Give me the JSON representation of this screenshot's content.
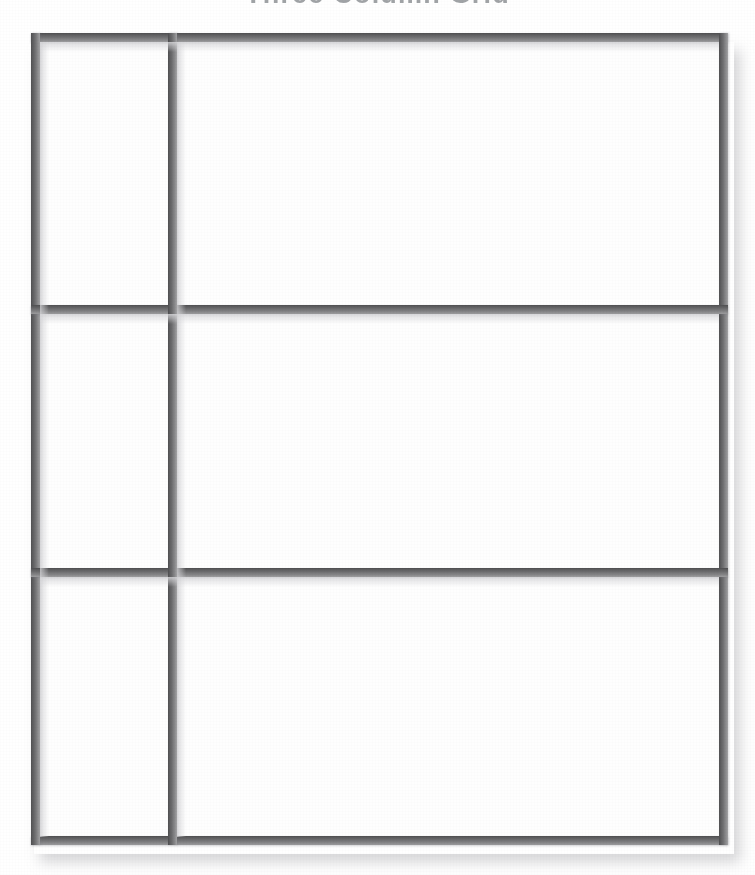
{
  "page": {
    "title": "Three Column Grid",
    "background_color": "#ffffff",
    "width": 755,
    "height": 875
  },
  "title_bar": {
    "text": "Three Column Grid",
    "cropped": "true",
    "color": "#555a60"
  },
  "frame": {
    "label": "grid-frame",
    "border_color": "#5d5d5f",
    "border_highlight_color": "#9d9d9f",
    "cell_fill_color": "#fefefe",
    "shadow_color": "#969699",
    "rows": 3,
    "columns": 2,
    "border_thickness_px": 8,
    "outer": {
      "left": 31,
      "top": 33,
      "width": 697,
      "height": 812
    },
    "dividers": {
      "vertical_x": [
        168
      ],
      "horizontal_y": [
        305,
        568
      ]
    }
  },
  "cells": [
    {
      "name": "cell-row1-col1",
      "row": 1,
      "column": 1,
      "content": ""
    },
    {
      "name": "cell-row1-col2",
      "row": 1,
      "column": 2,
      "content": ""
    },
    {
      "name": "cell-row2-col1",
      "row": 2,
      "column": 1,
      "content": ""
    },
    {
      "name": "cell-row2-col2",
      "row": 2,
      "column": 2,
      "content": ""
    },
    {
      "name": "cell-row3-col1",
      "row": 3,
      "column": 1,
      "content": ""
    },
    {
      "name": "cell-row3-col2",
      "row": 3,
      "column": 2,
      "content": ""
    }
  ]
}
